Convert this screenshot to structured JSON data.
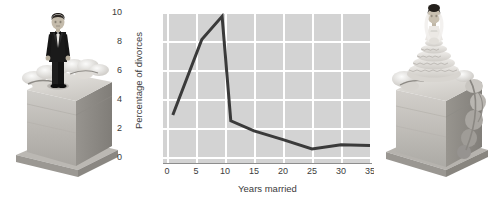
{
  "figure": {
    "background": "#ffffff",
    "left_photo": {
      "name": "groom-cake-photo",
      "alt": "Grayscale photo of a slice of wedding cake with a groom figurine in a black tuxedo standing on top, surrounded by white sugar flowers"
    },
    "right_photo": {
      "name": "bride-cake-photo",
      "alt": "Grayscale photo of a slice of wedding cake with a bride figurine in a tiered white gown standing on top, surrounded by white sugar flowers"
    }
  },
  "chart_data": {
    "type": "line",
    "title": "",
    "xlabel": "Years married",
    "ylabel": "Percentage of divorces",
    "xlim": [
      0,
      36
    ],
    "ylim": [
      0,
      10.4
    ],
    "xticks": [
      0,
      5,
      10,
      15,
      20,
      25,
      30,
      35
    ],
    "xtick_labels": [
      "0",
      "5",
      "10",
      "15",
      "20",
      "25",
      "30",
      "35"
    ],
    "yticks": [
      0,
      2,
      4,
      6,
      8,
      10
    ],
    "ytick_labels": [
      "0",
      "2",
      "4",
      "6",
      "8",
      "10"
    ],
    "grid": true,
    "legend": false,
    "plot_background": "#d3d3d3",
    "grid_color": "#ffffff",
    "line_color": "#3a3a3a",
    "line_width": 3,
    "x": [
      1,
      6,
      9.5,
      11,
      15,
      20,
      25,
      30,
      35
    ],
    "y": [
      2.9,
      8.1,
      9.7,
      2.5,
      1.8,
      1.2,
      0.55,
      0.85,
      0.8
    ],
    "series": [
      {
        "name": "Percentage of divorces",
        "points": [
          {
            "x": 1,
            "y": 2.9
          },
          {
            "x": 6,
            "y": 8.1
          },
          {
            "x": 9.5,
            "y": 9.7
          },
          {
            "x": 11,
            "y": 2.5
          },
          {
            "x": 15,
            "y": 1.8
          },
          {
            "x": 20,
            "y": 1.2
          },
          {
            "x": 25,
            "y": 0.55
          },
          {
            "x": 30,
            "y": 0.85
          },
          {
            "x": 35,
            "y": 0.8
          }
        ]
      }
    ]
  }
}
